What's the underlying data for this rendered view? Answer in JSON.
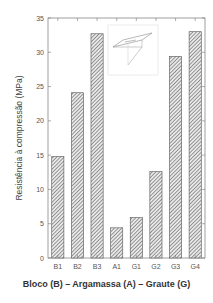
{
  "chart_data": {
    "type": "bar",
    "title": "",
    "xlabel": "Bloco (B) – Argamassa (A) – Graute (G)",
    "ylabel": "Resistência à compressão (MPa)",
    "categories": [
      "B1",
      "B2",
      "B3",
      "A1",
      "G1",
      "G2",
      "G3",
      "G4"
    ],
    "values": [
      14.8,
      24.1,
      32.7,
      4.4,
      5.9,
      12.6,
      29.4,
      33.0
    ],
    "ylim": [
      0,
      35
    ],
    "yticks": [
      0,
      5,
      10,
      15,
      20,
      25,
      30,
      35
    ],
    "grid": false,
    "legend": "none",
    "bar_fill": "diagonal-hatch",
    "bar_color": "#555555",
    "inset": "isometric sketch of prism specimen (top right)"
  }
}
